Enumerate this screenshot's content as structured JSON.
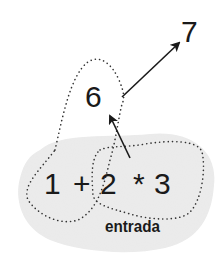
{
  "diagram": {
    "result_final": "7",
    "result_intermediate": "6",
    "expression": {
      "full": "1 + 2 * 3",
      "tokens": [
        "1",
        "+",
        "2",
        "*",
        "3"
      ]
    },
    "input_label": "entrada",
    "colors": {
      "background": "#ffffff",
      "input_region_fill": "#ececec",
      "ink": "#1a1a1a",
      "dotted_outline": "#333333"
    },
    "edges": [
      {
        "from": "subexpression-2*3",
        "to": "result-6",
        "style": "solid-arrow"
      },
      {
        "from": "subexpression-1+6",
        "to": "result-7",
        "style": "solid-arrow"
      }
    ]
  }
}
